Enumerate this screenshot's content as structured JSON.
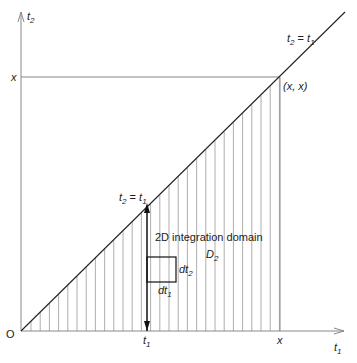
{
  "diagram": {
    "title": "2D integration domain D2",
    "axes": {
      "x_label": "t",
      "x_label_sub": "1",
      "y_label": "t",
      "y_label_sub": "2",
      "origin_label": "O"
    },
    "ticks": {
      "y_x_label": "x",
      "x_x_label": "x",
      "x_t1_label": "t",
      "x_t1_sub": "1"
    },
    "line_label_top": {
      "a": "t",
      "a_sub": "2",
      "eq": " = ",
      "b": "t",
      "b_sub": "1"
    },
    "line_label_mid": {
      "a": "t",
      "a_sub": "2",
      "eq": " = ",
      "b": "t",
      "b_sub": "1"
    },
    "point_label": "(x, x)",
    "domain_text": "2D integration domain",
    "domain_name": "D",
    "domain_sub": "2",
    "dt2_label": "dt",
    "dt2_sub": "2",
    "dt1_label": "dt",
    "dt1_sub": "1",
    "colors": {
      "line": "#222222",
      "hatch": "#888888",
      "axis": "#888888"
    }
  }
}
